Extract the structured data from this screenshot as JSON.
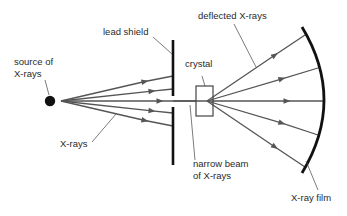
{
  "diagram": {
    "colors": {
      "ray": "#555555",
      "shield": "#111111",
      "film": "#111111",
      "source": "#111111",
      "crystal_stroke": "#444444",
      "leader": "#444444",
      "text": "#2a2a2a"
    },
    "labels": {
      "source": [
        "source of",
        "X-rays"
      ],
      "lead_shield": "lead shield",
      "x_rays": "X-rays",
      "crystal": "crystal",
      "deflected": "deflected X-rays",
      "narrow_beam": [
        "narrow beam",
        "of X-rays"
      ],
      "film": "X-ray film"
    },
    "components": [
      {
        "id": "source",
        "label": "source of X-rays",
        "shape": "filled-circle",
        "cx": 50,
        "cy": 101,
        "r": 5
      },
      {
        "id": "lead-shield",
        "label": "lead shield",
        "shape": "vertical-bar-with-slit",
        "x": 173,
        "upper": [
          40,
          96
        ],
        "lower": [
          107,
          165
        ]
      },
      {
        "id": "crystal",
        "label": "crystal",
        "shape": "rectangle",
        "x": 196,
        "y": 86,
        "w": 17,
        "h": 30
      },
      {
        "id": "film",
        "label": "X-ray film",
        "shape": "arc",
        "from": [
          302,
          27
        ],
        "to": [
          302,
          173
        ],
        "apex_x": 324
      }
    ],
    "incident_rays": {
      "origin": [
        61,
        101
      ],
      "targets_y_at_shield": [
        76,
        89,
        101,
        113,
        126
      ],
      "note": "only the central ray passes through the slit as a narrow beam"
    },
    "deflected_rays": {
      "origin": [
        207,
        101
      ],
      "film_hits": [
        [
          305,
          35
        ],
        [
          318,
          68
        ],
        [
          324,
          101
        ],
        [
          318,
          135
        ],
        [
          305,
          167
        ]
      ]
    },
    "connections": [
      {
        "from": "source",
        "to": "lead-shield",
        "label": "X-rays"
      },
      {
        "from": "lead-shield",
        "to": "crystal",
        "label": "narrow beam of X-rays"
      },
      {
        "from": "crystal",
        "to": "film",
        "label": "deflected X-rays"
      }
    ]
  }
}
